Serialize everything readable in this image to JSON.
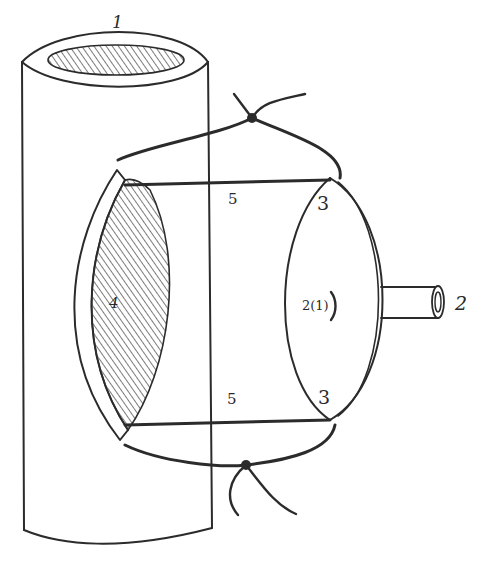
{
  "diagram": {
    "colors": {
      "ink": "#2b2b2b",
      "hatch": "#555555",
      "background": "#ffffff"
    },
    "labels": {
      "vessel": "1",
      "tube": "2",
      "disc": "2(1)",
      "disc_suture_top": "3",
      "disc_suture_bottom": "3",
      "opening": "4",
      "suture_top": "5",
      "suture_bottom": "5"
    },
    "components": [
      {
        "id": "1",
        "name": "vessel",
        "shape": "vertical cylinder with hatched lumen at top"
      },
      {
        "id": "4",
        "name": "opening",
        "shape": "lens-shaped hatched window in vessel wall"
      },
      {
        "id": "2(1)",
        "name": "disc",
        "shape": "elliptical flange"
      },
      {
        "id": "2",
        "name": "tube",
        "shape": "short horizontal tube projecting right from disc"
      },
      {
        "id": "3",
        "name": "disc-suture-points",
        "shape": "anchor points on disc rim"
      },
      {
        "id": "5",
        "name": "sutures",
        "shape": "threads connecting opening to disc, knotted above and below"
      }
    ]
  }
}
